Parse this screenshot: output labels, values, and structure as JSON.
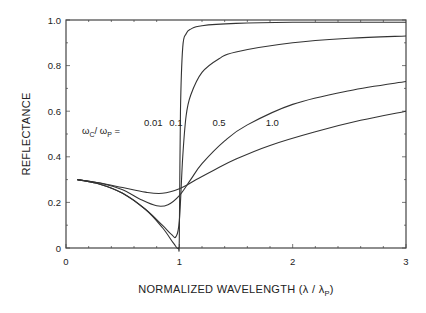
{
  "chart_data": {
    "type": "line",
    "title": "",
    "xlabel": "NORMALIZED WAVELENGTH (λ / λ",
    "xlabel_sub": "P",
    "xlabel_close": ")",
    "ylabel": "REFLECTANCE",
    "xlim": [
      0,
      3
    ],
    "ylim": [
      0,
      1.0
    ],
    "grid": false,
    "x_ticks": [
      0,
      1,
      2,
      3
    ],
    "x_tick_labels": [
      "0",
      "1",
      "2",
      "3"
    ],
    "y_ticks": [
      0,
      0.2,
      0.4,
      0.6,
      0.8,
      1.0
    ],
    "y_tick_labels": [
      "0",
      "0.2",
      "0.4",
      "0.6",
      "0.8",
      "1.0"
    ],
    "annotation": {
      "prefix": "ω",
      "sub1": "C",
      "mid": "/ ω",
      "sub2": "P",
      "suffix": " ="
    },
    "series": [
      {
        "name": "0.01",
        "x": [
          0.1,
          0.3,
          0.5,
          0.7,
          0.85,
          0.95,
          0.99,
          1.0,
          1.01,
          1.03,
          1.06,
          1.1,
          1.2,
          1.5,
          2.0,
          2.5,
          3.0
        ],
        "y": [
          0.3,
          0.28,
          0.24,
          0.17,
          0.09,
          0.02,
          0.0,
          0.05,
          0.6,
          0.88,
          0.94,
          0.96,
          0.975,
          0.985,
          0.99,
          0.99,
          0.99
        ]
      },
      {
        "name": "0.1",
        "x": [
          0.1,
          0.3,
          0.5,
          0.7,
          0.85,
          0.93,
          0.97,
          1.0,
          1.03,
          1.06,
          1.1,
          1.2,
          1.35,
          1.5,
          2.0,
          2.5,
          3.0
        ],
        "y": [
          0.3,
          0.28,
          0.24,
          0.17,
          0.1,
          0.06,
          0.05,
          0.12,
          0.4,
          0.58,
          0.67,
          0.77,
          0.83,
          0.86,
          0.9,
          0.92,
          0.93
        ]
      },
      {
        "name": "0.5",
        "x": [
          0.1,
          0.3,
          0.5,
          0.65,
          0.8,
          0.9,
          1.0,
          1.1,
          1.2,
          1.4,
          1.6,
          2.0,
          2.5,
          3.0
        ],
        "y": [
          0.3,
          0.285,
          0.255,
          0.215,
          0.185,
          0.19,
          0.23,
          0.3,
          0.37,
          0.47,
          0.54,
          0.63,
          0.69,
          0.73
        ]
      },
      {
        "name": "1.0",
        "x": [
          0.1,
          0.3,
          0.5,
          0.7,
          0.85,
          1.0,
          1.15,
          1.3,
          1.5,
          1.8,
          2.2,
          2.6,
          3.0
        ],
        "y": [
          0.3,
          0.285,
          0.265,
          0.245,
          0.24,
          0.26,
          0.3,
          0.34,
          0.39,
          0.45,
          0.51,
          0.56,
          0.6
        ]
      }
    ],
    "series_label_positions": [
      {
        "name": "0.01",
        "x": 0.77,
        "y": 0.55
      },
      {
        "name": "0.1",
        "x": 0.97,
        "y": 0.55
      },
      {
        "name": "0.5",
        "x": 1.35,
        "y": 0.55
      },
      {
        "name": "1.0",
        "x": 1.82,
        "y": 0.55
      }
    ],
    "leader_lines": [
      {
        "name": "0.5",
        "from": [
          1.22,
          0.595
        ],
        "to": [
          1.56,
          0.745
        ]
      },
      {
        "name": "0.5b",
        "from": [
          1.31,
          0.495
        ],
        "to": [
          1.09,
          0.3
        ]
      }
    ]
  }
}
